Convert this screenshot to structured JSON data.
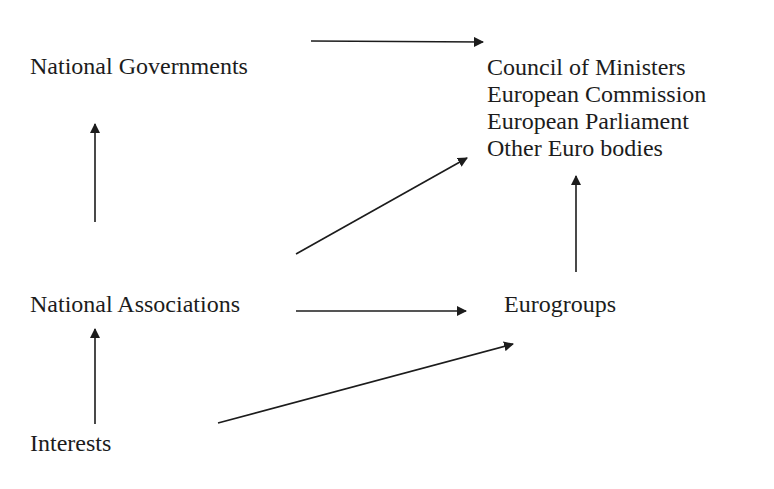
{
  "diagram": {
    "type": "flow",
    "nodes": {
      "national_governments": "National Governments",
      "european_institutions": [
        "Council of Ministers",
        "European Commission",
        "European Parliament",
        "Other Euro bodies"
      ],
      "national_associations": "National Associations",
      "eurogroups": "Eurogroups",
      "interests": "Interests"
    },
    "edges": [
      {
        "from": "National Governments",
        "to": "European institutions"
      },
      {
        "from": "National Associations",
        "to": "National Governments"
      },
      {
        "from": "National Associations",
        "to": "European institutions"
      },
      {
        "from": "National Associations",
        "to": "Eurogroups"
      },
      {
        "from": "Eurogroups",
        "to": "European institutions"
      },
      {
        "from": "Interests",
        "to": "National Associations"
      },
      {
        "from": "Interests",
        "to": "Eurogroups"
      }
    ],
    "colors": {
      "ink": "#1c1c1c",
      "background": "#ffffff"
    }
  }
}
